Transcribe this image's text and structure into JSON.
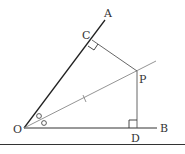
{
  "diagram": {
    "type": "geometry-angle-bisector",
    "points": {
      "O": {
        "label": "O",
        "x": 24,
        "y": 128
      },
      "A": {
        "label": "A",
        "x": 105,
        "y": 20
      },
      "B": {
        "label": "B",
        "x": 157,
        "y": 128
      },
      "C": {
        "label": "C",
        "x": 92,
        "y": 40
      },
      "P": {
        "label": "P",
        "x": 137,
        "y": 71
      },
      "D": {
        "label": "D",
        "x": 137,
        "y": 128
      }
    },
    "labels": {
      "O": "O",
      "A": "A",
      "B": "B",
      "C": "C",
      "P": "P",
      "D": "D"
    },
    "annotations": {
      "right_angle_at_C": true,
      "right_angle_at_D": true,
      "equal_angle_marks_at_O": "circles",
      "tick_on_OP": true
    },
    "colors": {
      "ray_OA": "#222222",
      "ray_OB": "#333333",
      "bisector": "#888888",
      "perpendiculars": "#555555",
      "baseline": "#333333"
    }
  }
}
